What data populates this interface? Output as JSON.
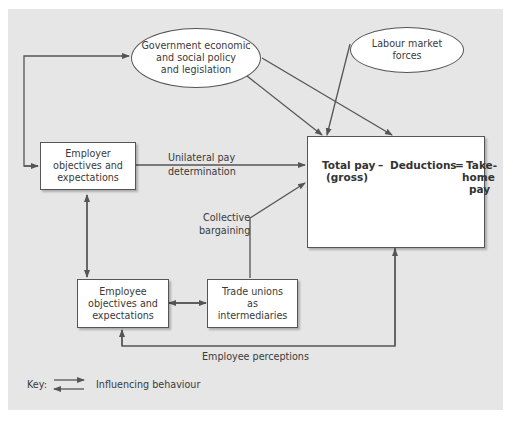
{
  "diagram": {
    "nodes": {
      "government": "Government economic and social policy and legislation",
      "government_lines": [
        "Government economic",
        "and social policy",
        "and legislation"
      ],
      "labour_market_lines": [
        "Labour market",
        "forces"
      ],
      "employer_lines": [
        "Employer",
        "objectives and",
        "expectations"
      ],
      "employee_lines": [
        "Employee",
        "objectives and",
        "expectations"
      ],
      "unions_lines": [
        "Trade unions",
        "as",
        "intermediaries"
      ]
    },
    "result": {
      "total_pay": "Total pay",
      "minus": "–",
      "deductions": "Deductions",
      "equals": "=",
      "take": "Take-",
      "gross": "(gross)",
      "home": "home",
      "pay": "pay"
    },
    "edge_labels": {
      "unilateral_1": "Unilateral pay",
      "unilateral_2": "determination",
      "collective_1": "Collective",
      "collective_2": "bargaining",
      "perceptions": "Employee perceptions"
    },
    "key": {
      "label": "Key:",
      "description": "Influencing behaviour"
    }
  },
  "colors": {
    "panel": "#e6e6e6",
    "box": "#ffffff",
    "line": "#555555"
  }
}
